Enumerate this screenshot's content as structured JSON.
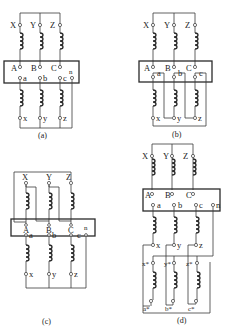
{
  "diagrams": {
    "a": {
      "caption": "(a)",
      "primary_labels": [
        "X",
        "Y",
        "Z"
      ],
      "box_labels_upper": [
        "A",
        "B",
        "C"
      ],
      "box_labels_lower": [
        "a",
        "b",
        "c"
      ],
      "neutral_label": "n",
      "secondary_labels": [
        "x",
        "y",
        "z"
      ]
    },
    "b": {
      "caption": "(b)",
      "primary_labels": [
        "X",
        "Y",
        "Z"
      ],
      "box_labels_upper": [
        "A",
        "B",
        "C"
      ],
      "box_labels_lower": [
        "a",
        "b",
        "c"
      ],
      "secondary_labels": [
        "x",
        "y",
        "z"
      ]
    },
    "c": {
      "caption": "(c)",
      "primary_labels": [
        "X",
        "Y",
        "Z"
      ],
      "box_labels_upper": [
        "A",
        "B",
        "C"
      ],
      "box_labels_lower": [
        "a",
        "b",
        "c"
      ],
      "neutral_label": "n",
      "secondary_labels": [
        "x",
        "y",
        "z"
      ]
    },
    "d": {
      "caption": "(d)",
      "primary_labels": [
        "X",
        "Y",
        "Z"
      ],
      "box_labels_upper": [
        "A",
        "B",
        "C"
      ],
      "box_labels_lower": [
        "a",
        "b",
        "c"
      ],
      "neutral_label": "n",
      "secondary_labels": [
        "x",
        "y",
        "z"
      ],
      "tertiary_top_labels": [
        "x*",
        "y*",
        "z*"
      ],
      "tertiary_bottom_labels": [
        "a*",
        "b*",
        "c*"
      ]
    }
  }
}
